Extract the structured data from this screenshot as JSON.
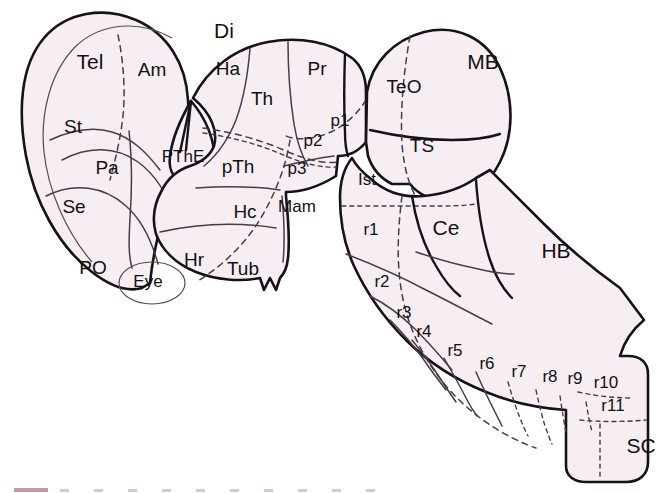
{
  "figure": {
    "style": {
      "fill": "#f6eef3",
      "outline": "#17121a",
      "inner_line": "#4a3b47",
      "dashed_line": "#4a3b47",
      "label_color": "#141014",
      "background": "#ffffff"
    }
  },
  "major_divisions": [
    {
      "id": "tel",
      "abbr": "Tel",
      "name": "Telencephalon",
      "x": 90,
      "y": 63
    },
    {
      "id": "di",
      "abbr": "Di",
      "name": "Diencephalon",
      "x": 224,
      "y": 32
    },
    {
      "id": "mb",
      "abbr": "MB",
      "name": "Midbrain",
      "x": 483,
      "y": 63
    },
    {
      "id": "hb",
      "abbr": "HB",
      "name": "Hindbrain",
      "x": 556,
      "y": 252
    },
    {
      "id": "sc",
      "abbr": "SC",
      "name": "Spinal cord",
      "x": 641,
      "y": 447
    }
  ],
  "telencephalic_regions": [
    {
      "abbr": "Am",
      "name": "Amygdala",
      "x": 152,
      "y": 71
    },
    {
      "abbr": "St",
      "name": "Striatum",
      "x": 73,
      "y": 128
    },
    {
      "abbr": "Pa",
      "name": "Pallidum",
      "x": 107,
      "y": 169
    },
    {
      "abbr": "Se",
      "name": "Septum",
      "x": 74,
      "y": 208
    },
    {
      "abbr": "PO",
      "name": "Preoptic area",
      "x": 93,
      "y": 269
    }
  ],
  "diencephalic_regions": [
    {
      "abbr": "Ha",
      "name": "Habenula",
      "x": 228,
      "y": 70
    },
    {
      "abbr": "Th",
      "name": "Thalamus",
      "x": 262,
      "y": 100
    },
    {
      "abbr": "Pr",
      "name": "Pretectum",
      "x": 317,
      "y": 70
    },
    {
      "abbr": "p1",
      "name": "Prosomere 1",
      "x": 340,
      "y": 122
    },
    {
      "abbr": "p2",
      "name": "Prosomere 2",
      "x": 313,
      "y": 142
    },
    {
      "abbr": "p3",
      "name": "Prosomere 3",
      "x": 297,
      "y": 170
    },
    {
      "abbr": "PThE",
      "name": "Prethalamic eminence",
      "x": 183,
      "y": 158
    },
    {
      "abbr": "pTh",
      "name": "Prethalamus",
      "x": 238,
      "y": 168
    },
    {
      "abbr": "Mam",
      "name": "Mammillary area",
      "x": 297,
      "y": 208
    },
    {
      "abbr": "Hc",
      "name": "Caudal hypothalamus",
      "x": 245,
      "y": 213
    },
    {
      "abbr": "Hr",
      "name": "Rostral hypothalamus",
      "x": 194,
      "y": 261
    },
    {
      "abbr": "Tub",
      "name": "Tuberal hypothalamus",
      "x": 243,
      "y": 270
    },
    {
      "abbr": "Eye",
      "name": "Eye / optic vesicle",
      "x": 148,
      "y": 283
    }
  ],
  "midbrain_regions": [
    {
      "abbr": "TeO",
      "name": "Optic tectum",
      "x": 404,
      "y": 88
    },
    {
      "abbr": "TS",
      "name": "Torus semicircularis",
      "x": 422,
      "y": 147
    }
  ],
  "hindbrain_regions": [
    {
      "abbr": "Ist",
      "name": "Isthmus",
      "x": 367,
      "y": 181
    },
    {
      "abbr": "Ce",
      "name": "Cerebellum",
      "x": 446,
      "y": 229
    }
  ],
  "rhombomeres": [
    {
      "abbr": "r1",
      "name": "Rhombomere 1",
      "x": 371,
      "y": 231
    },
    {
      "abbr": "r2",
      "name": "Rhombomere 2",
      "x": 382,
      "y": 283
    },
    {
      "abbr": "r3",
      "name": "Rhombomere 3",
      "x": 404,
      "y": 314
    },
    {
      "abbr": "r4",
      "name": "Rhombomere 4",
      "x": 424,
      "y": 333
    },
    {
      "abbr": "r5",
      "name": "Rhombomere 5",
      "x": 455,
      "y": 352
    },
    {
      "abbr": "r6",
      "name": "Rhombomere 6",
      "x": 487,
      "y": 365
    },
    {
      "abbr": "r7",
      "name": "Rhombomere 7",
      "x": 519,
      "y": 373
    },
    {
      "abbr": "r8",
      "name": "Rhombomere 8",
      "x": 550,
      "y": 378
    },
    {
      "abbr": "r9",
      "name": "Rhombomere 9",
      "x": 575,
      "y": 380
    },
    {
      "abbr": "r10",
      "name": "Rhombomere 10",
      "x": 606,
      "y": 384
    },
    {
      "abbr": "r11",
      "name": "Rhombomere 11",
      "x": 613,
      "y": 407
    }
  ]
}
